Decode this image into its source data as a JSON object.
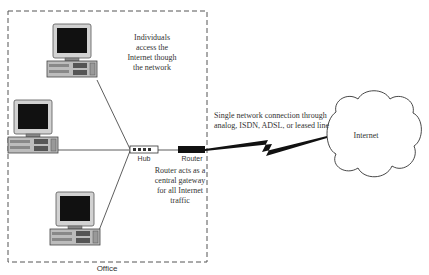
{
  "diagram": {
    "office": {
      "label": "Office",
      "border_style": "dashed"
    },
    "computers": [
      {
        "id": "computer-top",
        "icon": "desktop-computer-icon"
      },
      {
        "id": "computer-left",
        "icon": "desktop-computer-icon"
      },
      {
        "id": "computer-bottom",
        "icon": "desktop-computer-icon"
      }
    ],
    "hub": {
      "label": "Hub",
      "icon": "hub-icon"
    },
    "router": {
      "label": "Router",
      "icon": "router-icon"
    },
    "internet": {
      "label": "Internet",
      "icon": "cloud-icon"
    },
    "annotations": {
      "individuals": {
        "lines": [
          "Individuals",
          "access the",
          "Internet though",
          "the network"
        ]
      },
      "router_gateway": {
        "lines": [
          "Router acts as a",
          "central gateway",
          "for all Internet",
          "traffic"
        ]
      },
      "connection": {
        "lines": [
          "Single network connection through",
          "analog, ISDN, ADSL, or leased line"
        ]
      }
    },
    "links": [
      {
        "from": "computer-top",
        "to": "hub",
        "type": "line"
      },
      {
        "from": "computer-left",
        "to": "hub",
        "type": "line"
      },
      {
        "from": "computer-bottom",
        "to": "hub",
        "type": "line"
      },
      {
        "from": "hub",
        "to": "router",
        "type": "line"
      },
      {
        "from": "router",
        "to": "internet",
        "type": "lightning"
      }
    ],
    "colors": {
      "line": "#333333",
      "screen": "#111111",
      "monitor_body": "#cfcfcf",
      "router_body": "#111111",
      "text": "#333333"
    }
  }
}
